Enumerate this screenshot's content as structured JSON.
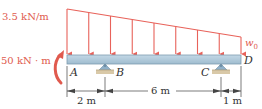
{
  "diagram": {
    "type": "beam-loading",
    "load": {
      "left_intensity_label": "3.5 kN/m",
      "right_intensity_label": "w0",
      "right_intensity_symbol": "w",
      "right_intensity_subscript": "0",
      "arrow_count": 9,
      "shape": "linearly decreasing distributed load"
    },
    "moment": {
      "label": "50 kN · m",
      "direction": "counterclockwise"
    },
    "points": {
      "A": "A",
      "B": "B",
      "C": "C",
      "D": "D"
    },
    "supports": [
      {
        "at": "B",
        "type": "pin"
      },
      {
        "at": "C",
        "type": "pin"
      }
    ],
    "dimensions": [
      {
        "from": "A",
        "to": "B",
        "label": "2 m"
      },
      {
        "from": "B",
        "to": "C",
        "label": "6 m"
      },
      {
        "from": "C",
        "to": "D",
        "label": "1 m"
      }
    ],
    "colors": {
      "load": "#e8625a",
      "beam_fill": "#a9c4d6",
      "beam_edge": "#7e9cb0",
      "support": "#8fb0c8",
      "ground": "#d9c9a8",
      "dimension": "#444444",
      "text_red": "#e05a4e"
    }
  }
}
